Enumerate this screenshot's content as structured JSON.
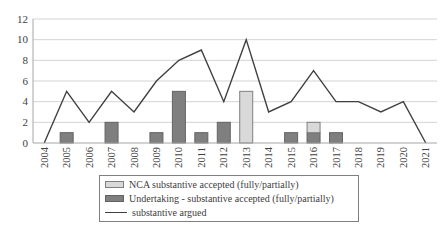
{
  "chart_data": {
    "type": "combo-bar-line",
    "categories": [
      "2004",
      "2005",
      "2006",
      "2007",
      "2008",
      "2009",
      "2010",
      "2011",
      "2012",
      "2013",
      "2014",
      "2015",
      "2016",
      "2017",
      "2018",
      "2019",
      "2020",
      "2021"
    ],
    "series": [
      {
        "name": "NCA substantive accepted (fully/partially)",
        "type": "bar",
        "stack": "accepted",
        "stack_level": "top",
        "fill": "#d9d9d9",
        "stroke": "#7f7f7f",
        "values": [
          0,
          0,
          0,
          0,
          0,
          0,
          0,
          0,
          0,
          5,
          0,
          0,
          1,
          0,
          0,
          0,
          0,
          0
        ]
      },
      {
        "name": "Undertaking - substantive accepted (fully/partially)",
        "type": "bar",
        "stack": "accepted",
        "stack_level": "bottom",
        "fill": "#7f7f7f",
        "stroke": "#636363",
        "values": [
          0,
          1,
          0,
          2,
          0,
          1,
          5,
          1,
          2,
          0,
          0,
          1,
          1,
          1,
          0,
          0,
          0,
          0
        ]
      },
      {
        "name": "substantive argued",
        "type": "line",
        "color": "#404040",
        "values": [
          0,
          5,
          2,
          5,
          3,
          6,
          8,
          9,
          4,
          10,
          3,
          4,
          7,
          4,
          4,
          3,
          4,
          0
        ]
      }
    ],
    "title": "",
    "xlabel": "",
    "ylabel": "",
    "ylim": [
      0,
      12
    ],
    "ytick_step": 2,
    "grid": true,
    "legend_position": "bottom-center"
  },
  "legend": {
    "entries": [
      {
        "label": "NCA substantive accepted (fully/partially)",
        "swatch": "light-gray-bar"
      },
      {
        "label": "Undertaking - substantive accepted (fully/partially)",
        "swatch": "dark-gray-bar"
      },
      {
        "label": "substantive argued",
        "swatch": "line"
      }
    ]
  },
  "style": {
    "gridline_color": "#d3d3d3",
    "axis_color": "#a6a6a6",
    "tick_text_color": "#404040",
    "line_color": "#404040",
    "nca_fill": "#d9d9d9",
    "nca_stroke": "#7f7f7f",
    "undertaking_fill": "#7f7f7f",
    "undertaking_stroke": "#636363",
    "legend_border": "#808080",
    "background": "#ffffff"
  }
}
